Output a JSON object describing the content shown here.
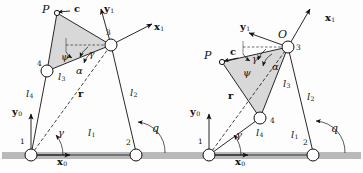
{
  "figure": {
    "name": "four-bar-linkage-two-configurations",
    "background_color": "#fdfdfd",
    "ground_color": "#b9b9b9",
    "coupler_fill": "#d8d8d8",
    "stroke_color": "#111111"
  },
  "diagrams": [
    {
      "id": "left",
      "joints": [
        {
          "id": "1",
          "label": "1"
        },
        {
          "id": "2",
          "label": "2"
        },
        {
          "id": "3",
          "label": "3"
        },
        {
          "id": "4",
          "label": "4"
        }
      ],
      "point_p": "P",
      "apex_label": "",
      "links": [
        {
          "name": "l1",
          "base": "l",
          "sub": "1"
        },
        {
          "name": "l2",
          "base": "l",
          "sub": "2"
        },
        {
          "name": "l3",
          "base": "l",
          "sub": "3"
        },
        {
          "name": "l4",
          "base": "l",
          "sub": "4"
        }
      ],
      "angles": [
        {
          "name": "alpha",
          "glyph": "α"
        },
        {
          "name": "gamma-coupler",
          "glyph": "γ"
        },
        {
          "name": "psi",
          "glyph": "ψ"
        },
        {
          "name": "gamma-base",
          "glyph": "γ"
        },
        {
          "name": "q",
          "glyph": "q"
        }
      ],
      "vectors": [
        {
          "name": "r",
          "glyph": "r"
        },
        {
          "name": "c",
          "glyph": "c"
        }
      ],
      "axes": [
        {
          "name": "x0",
          "base": "x",
          "sub": "0"
        },
        {
          "name": "y0",
          "base": "y",
          "sub": "0"
        },
        {
          "name": "x1",
          "base": "x",
          "sub": "1"
        },
        {
          "name": "y1",
          "base": "y",
          "sub": "1"
        }
      ]
    },
    {
      "id": "right",
      "joints": [
        {
          "id": "1",
          "label": "1"
        },
        {
          "id": "2",
          "label": "2"
        },
        {
          "id": "3",
          "label": "3"
        },
        {
          "id": "4",
          "label": "4"
        }
      ],
      "point_p": "P",
      "apex_label": "O",
      "links": [
        {
          "name": "l1",
          "base": "l",
          "sub": "1"
        },
        {
          "name": "l2",
          "base": "l",
          "sub": "2"
        },
        {
          "name": "l3",
          "base": "l",
          "sub": "3"
        },
        {
          "name": "l4",
          "base": "l",
          "sub": "4"
        }
      ],
      "angles": [
        {
          "name": "alpha",
          "glyph": "α"
        },
        {
          "name": "gamma-coupler",
          "glyph": "γ"
        },
        {
          "name": "psi",
          "glyph": "ψ"
        },
        {
          "name": "gamma-base",
          "glyph": "γ"
        },
        {
          "name": "q",
          "glyph": "q"
        }
      ],
      "vectors": [
        {
          "name": "r",
          "glyph": "r"
        },
        {
          "name": "c",
          "glyph": "c"
        }
      ],
      "axes": [
        {
          "name": "x0",
          "base": "x",
          "sub": "0"
        },
        {
          "name": "y0",
          "base": "y",
          "sub": "0"
        },
        {
          "name": "x1",
          "base": "x",
          "sub": "1"
        },
        {
          "name": "y1",
          "base": "y",
          "sub": "1"
        }
      ]
    }
  ]
}
